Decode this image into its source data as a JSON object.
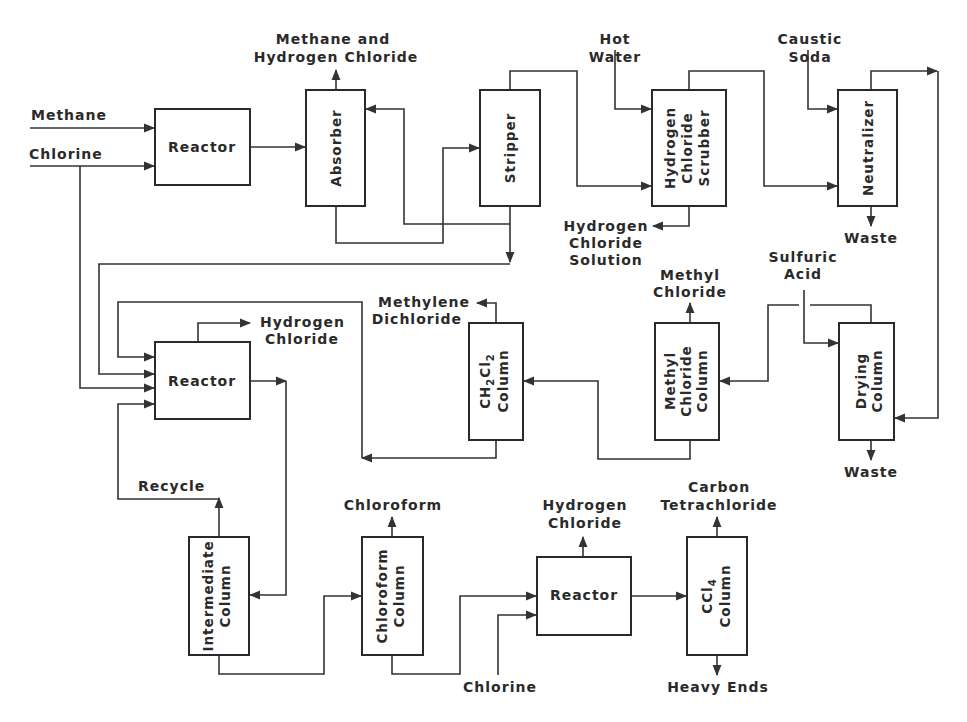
{
  "diagram": {
    "type": "process-flow",
    "units": [
      {
        "id": "reactor1",
        "label": "Reactor"
      },
      {
        "id": "absorber",
        "label": "Absorber"
      },
      {
        "id": "stripper",
        "label": "Stripper"
      },
      {
        "id": "hcl_scrubber",
        "lines": [
          "Hydrogen",
          "Chloride",
          "Scrubber"
        ]
      },
      {
        "id": "neutralizer",
        "label": "Neutralizer"
      },
      {
        "id": "reactor2",
        "label": "Reactor"
      },
      {
        "id": "ch2cl2_column",
        "lines": [
          "CH2Cl2",
          "Column"
        ]
      },
      {
        "id": "methyl_chloride_column",
        "lines": [
          "Methyl",
          "Chloride",
          "Column"
        ]
      },
      {
        "id": "drying_column",
        "lines": [
          "Drying",
          "Column"
        ]
      },
      {
        "id": "intermediate_column",
        "lines": [
          "Intermediate",
          "Column"
        ]
      },
      {
        "id": "chloroform_column",
        "lines": [
          "Chloroform",
          "Column"
        ]
      },
      {
        "id": "reactor3",
        "label": "Reactor"
      },
      {
        "id": "ccl4_column",
        "lines": [
          "CCl4",
          "Column"
        ]
      }
    ],
    "streams": {
      "methane_in": "Methane",
      "chlorine_in": "Chlorine",
      "absorber_top": [
        "Methane and",
        "Hydrogen Chloride"
      ],
      "hot_water": [
        "Hot",
        "Water"
      ],
      "hcl_solution": [
        "Hydrogen",
        "Chloride",
        "Solution"
      ],
      "caustic_soda": [
        "Caustic",
        "Soda"
      ],
      "neutralizer_waste": "Waste",
      "sulfuric_acid": [
        "Sulfuric",
        "Acid"
      ],
      "drying_waste": "Waste",
      "methyl_chloride": [
        "Methyl",
        "Chloride"
      ],
      "methylene_dichloride": [
        "Methylene",
        "Dichloride"
      ],
      "reactor2_hcl": [
        "Hydrogen",
        "Chloride"
      ],
      "recycle": "Recycle",
      "chloroform": "Chloroform",
      "reactor3_hcl": [
        "Hydrogen",
        "Chloride"
      ],
      "chlorine_in_2": "Chlorine",
      "carbon_tetrachloride": [
        "Carbon",
        "Tetrachloride"
      ],
      "heavy_ends": "Heavy Ends"
    },
    "connections": [
      [
        "Methane",
        "reactor1"
      ],
      [
        "Chlorine",
        "reactor1"
      ],
      [
        "Chlorine",
        "reactor2"
      ],
      [
        "reactor1",
        "absorber"
      ],
      [
        "absorber",
        "Methane and Hydrogen Chloride"
      ],
      [
        "absorber",
        "stripper"
      ],
      [
        "stripper",
        "absorber"
      ],
      [
        "stripper",
        "hcl_scrubber"
      ],
      [
        "stripper",
        "reactor2"
      ],
      [
        "Hot Water",
        "hcl_scrubber"
      ],
      [
        "hcl_scrubber",
        "Hydrogen Chloride Solution"
      ],
      [
        "hcl_scrubber",
        "neutralizer"
      ],
      [
        "Caustic Soda",
        "neutralizer"
      ],
      [
        "neutralizer",
        "Waste"
      ],
      [
        "neutralizer",
        "drying_column"
      ],
      [
        "Sulfuric Acid",
        "drying_column"
      ],
      [
        "drying_column",
        "Waste"
      ],
      [
        "drying_column",
        "methyl_chloride_column"
      ],
      [
        "methyl_chloride_column",
        "Methyl Chloride"
      ],
      [
        "methyl_chloride_column",
        "ch2cl2_column"
      ],
      [
        "ch2cl2_column",
        "Methylene Dichloride"
      ],
      [
        "ch2cl2_column",
        "reactor2"
      ],
      [
        "reactor2",
        "Hydrogen Chloride"
      ],
      [
        "reactor2",
        "intermediate_column"
      ],
      [
        "intermediate_column",
        "Recycle"
      ],
      [
        "Recycle",
        "reactor2"
      ],
      [
        "intermediate_column",
        "chloroform_column"
      ],
      [
        "chloroform_column",
        "Chloroform"
      ],
      [
        "chloroform_column",
        "reactor3"
      ],
      [
        "Chlorine",
        "reactor3"
      ],
      [
        "reactor3",
        "Hydrogen Chloride"
      ],
      [
        "reactor3",
        "ccl4_column"
      ],
      [
        "ccl4_column",
        "Carbon Tetrachloride"
      ],
      [
        "ccl4_column",
        "Heavy Ends"
      ]
    ]
  }
}
